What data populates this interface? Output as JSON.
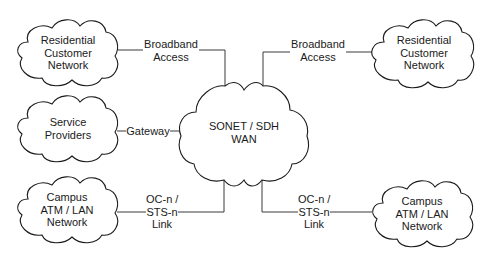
{
  "diagram": {
    "type": "network-topology",
    "center": {
      "id": "wan",
      "lines": [
        "SONET / SDH",
        "WAN"
      ]
    },
    "nodes": [
      {
        "id": "res-left",
        "lines": [
          "Residential",
          "Customer",
          "Network"
        ]
      },
      {
        "id": "res-right",
        "lines": [
          "Residential",
          "Customer",
          "Network"
        ]
      },
      {
        "id": "service",
        "lines": [
          "Service",
          "Providers"
        ]
      },
      {
        "id": "campus-left",
        "lines": [
          "Campus",
          "ATM / LAN",
          "Network"
        ]
      },
      {
        "id": "campus-right",
        "lines": [
          "Campus",
          "ATM / LAN",
          "Network"
        ]
      }
    ],
    "edges": [
      {
        "from": "res-left",
        "to": "wan",
        "lines": [
          "Broadband",
          "Access"
        ]
      },
      {
        "from": "res-right",
        "to": "wan",
        "lines": [
          "Broadband",
          "Access"
        ]
      },
      {
        "from": "service",
        "to": "wan",
        "lines": [
          "Gateway"
        ]
      },
      {
        "from": "campus-left",
        "to": "wan",
        "lines": [
          "OC-n /",
          "STS-n",
          "Link"
        ]
      },
      {
        "from": "campus-right",
        "to": "wan",
        "lines": [
          "OC-n /",
          "STS-n",
          "Link"
        ]
      }
    ]
  },
  "colors": {
    "stroke": "#1a1a1a",
    "line": "#3a3a3a",
    "background": "#ffffff"
  }
}
